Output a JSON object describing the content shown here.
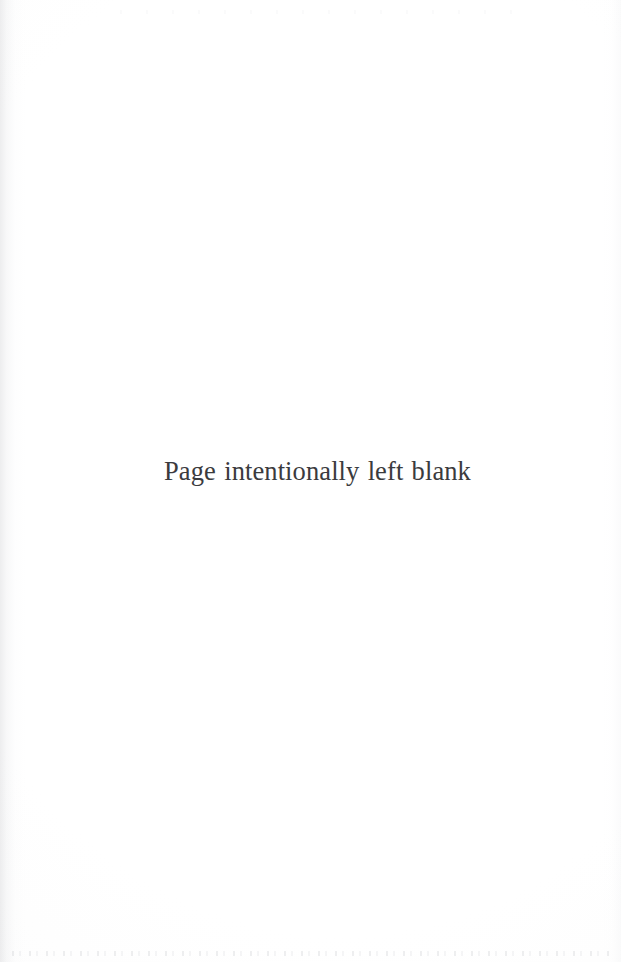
{
  "page": {
    "kind": "scanned-book-page",
    "width": 621,
    "height": 962,
    "background_color": "#fefefe",
    "notice_text": "Page intentionally left blank",
    "notice_color": "#3b3b3e"
  }
}
